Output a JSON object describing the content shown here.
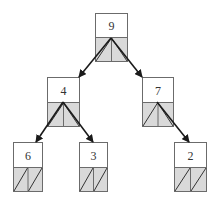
{
  "diagram": {
    "type": "binary-tree",
    "colors": {
      "border": "#6b6b6b",
      "pointer_fill": "#d9d9d9",
      "value_fill": "#ffffff",
      "edge": "#1a1a1a",
      "text": "#333333"
    },
    "nodes": [
      {
        "id": "n9",
        "value": "9",
        "x": 95,
        "y": 13,
        "w": 32,
        "h": 48,
        "left": "n4",
        "right": "n7"
      },
      {
        "id": "n4",
        "value": "4",
        "x": 47,
        "y": 77,
        "w": 32,
        "h": 49,
        "left": "n6",
        "right": "n3"
      },
      {
        "id": "n7",
        "value": "7",
        "x": 142,
        "y": 77,
        "w": 31,
        "h": 49,
        "left": null,
        "right": "n2"
      },
      {
        "id": "n6",
        "value": "6",
        "x": 13,
        "y": 142,
        "w": 29,
        "h": 49,
        "left": null,
        "right": null
      },
      {
        "id": "n3",
        "value": "3",
        "x": 79,
        "y": 142,
        "w": 28,
        "h": 49,
        "left": null,
        "right": null
      },
      {
        "id": "n2",
        "value": "2",
        "x": 174,
        "y": 142,
        "w": 32,
        "h": 49,
        "left": null,
        "right": null
      }
    ],
    "edges": [
      {
        "from": "n9",
        "to": "n4",
        "x1": 111,
        "y1": 38,
        "x2": 79,
        "y2": 77
      },
      {
        "from": "n9",
        "to": "n7",
        "x1": 111,
        "y1": 38,
        "x2": 142,
        "y2": 77
      },
      {
        "from": "n4",
        "to": "n6",
        "x1": 63,
        "y1": 102,
        "x2": 36,
        "y2": 142
      },
      {
        "from": "n4",
        "to": "n3",
        "x1": 63,
        "y1": 102,
        "x2": 93,
        "y2": 142
      },
      {
        "from": "n7",
        "to": "n2",
        "x1": 157,
        "y1": 102,
        "x2": 189,
        "y2": 142
      }
    ]
  }
}
